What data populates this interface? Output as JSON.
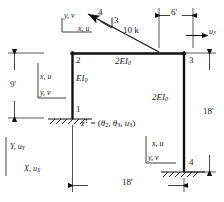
{
  "figure": {
    "line_color": "#111111",
    "text_color": "#1a1a1a"
  },
  "nodes": [
    {
      "id": "node-1",
      "label": "1"
    },
    {
      "id": "node-2",
      "label": "2"
    },
    {
      "id": "node-3",
      "label": "3"
    },
    {
      "id": "node-4",
      "label": "4"
    }
  ],
  "members": {
    "left_column_label": "EI",
    "left_column_sub": "0",
    "top_beam_label": "2EI",
    "top_beam_sub": "0",
    "right_column_label": "2EI",
    "right_column_sub": "0"
  },
  "load": {
    "magnitude_label": "10 k",
    "slope_run": "4",
    "slope_rise": "3"
  },
  "dimensions": {
    "left_height": "9'",
    "right_height": "18'",
    "span": "18'",
    "load_offset": "6'"
  },
  "dof": {
    "equation_z": "z",
    "equation_sup": "T",
    "equation_eq": "= (",
    "theta": "θ",
    "theta2_sub": "2",
    "theta3_sub": "3",
    "comma": ", ",
    "u_symbol": "u",
    "u3_sub": "3",
    "close": ")",
    "reaction_u": "u",
    "reaction_u_sub": "3"
  },
  "local_axes": [
    {
      "id": "axes-top-left",
      "vertical": "y, v",
      "horizontal": "x, u"
    },
    {
      "id": "axes-left-column",
      "vertical": "y, v",
      "horizontal": "x, u"
    },
    {
      "id": "axes-right-column",
      "vertical": "y, v",
      "horizontal": "x, u"
    }
  ],
  "global_axes": {
    "vertical_label": "Y, u",
    "vertical_sub": "Y",
    "horizontal_label": "X, u",
    "horizontal_sub": "X"
  }
}
